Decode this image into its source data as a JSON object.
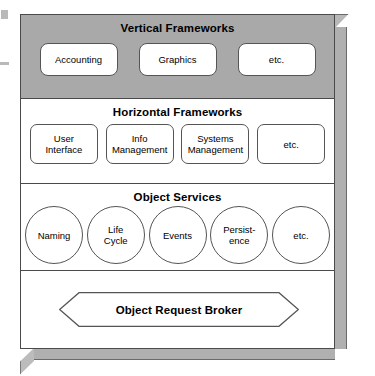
{
  "diagram": {
    "colors": {
      "band_gray": "#a9a9a9",
      "band_white": "#ffffff",
      "outline": "#4a4a4a",
      "node_outline": "#555555",
      "extrusion": "#b0b0b0"
    },
    "bands": [
      {
        "id": "vertical-frameworks",
        "title": "Vertical Frameworks",
        "shading": "gray",
        "node_shape": "rounded-rect",
        "nodes": [
          {
            "label": "Accounting"
          },
          {
            "label": "Graphics"
          },
          {
            "label": "etc."
          }
        ]
      },
      {
        "id": "horizontal-frameworks",
        "title": "Horizontal Frameworks",
        "shading": "white",
        "node_shape": "rounded-rect",
        "nodes": [
          {
            "line1": "User",
            "line2": "Interface"
          },
          {
            "line1": "Info",
            "line2": "Management"
          },
          {
            "line1": "Systems",
            "line2": "Management"
          },
          {
            "line1": "etc.",
            "line2": ""
          }
        ]
      },
      {
        "id": "object-services",
        "title": "Object Services",
        "shading": "white",
        "node_shape": "circle",
        "nodes": [
          {
            "line1": "Naming",
            "line2": ""
          },
          {
            "line1": "Life",
            "line2": "Cycle"
          },
          {
            "line1": "Events",
            "line2": ""
          },
          {
            "line1": "Persist-",
            "line2": "ence"
          },
          {
            "line1": "etc.",
            "line2": ""
          }
        ]
      },
      {
        "id": "object-request-broker",
        "title": "",
        "shading": "white",
        "node_shape": "hexagon",
        "nodes": [
          {
            "label": "Object Request Broker"
          }
        ]
      }
    ]
  }
}
